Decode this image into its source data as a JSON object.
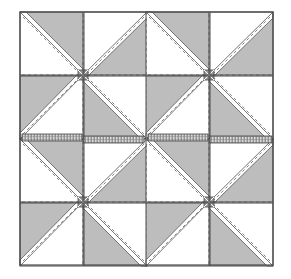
{
  "diagram": {
    "type": "quilt-pattern",
    "grid": {
      "blocks_x": 2,
      "blocks_y": 2,
      "quadrants_per_block": 4
    },
    "bounds": {
      "x": 20,
      "y": 12,
      "width": 253,
      "height": 253
    },
    "colors": {
      "background": "#ffffff",
      "shade": "#bdbdbd",
      "light": "#ffffff",
      "outline": "#4a4a4a",
      "stitch": "#7a7a7a",
      "sashing": "#9a9a9a"
    },
    "block_pattern": "pinwheel",
    "has_seam_allowance_strips": true,
    "has_dashed_stitch_lines": true
  }
}
